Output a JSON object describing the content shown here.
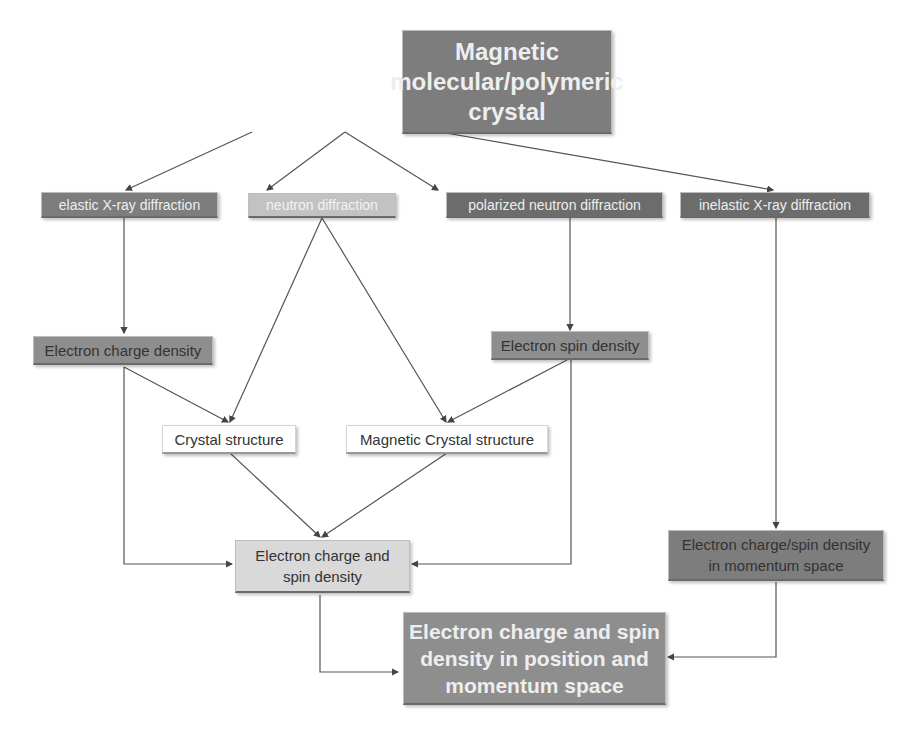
{
  "diagram": {
    "root": {
      "label_lines": [
        "Magnetic",
        "molecular/polymeric",
        "crystal"
      ]
    },
    "methods": [
      {
        "label": "elastic X-ray diffraction"
      },
      {
        "label": "neutron diffraction"
      },
      {
        "label": "polarized neutron diffraction"
      },
      {
        "label": "inelastic X-ray diffraction"
      }
    ],
    "intermediate": {
      "charge_density": "Electron charge density",
      "spin_density": "Electron spin density",
      "crystal_structure": "Crystal structure",
      "magnetic_crystal_structure": "Magnetic Crystal structure",
      "charge_spin_density_lines": [
        "Electron charge and",
        "spin density"
      ],
      "momentum_density_lines": [
        "Electron charge/spin density",
        "in momentum space"
      ]
    },
    "final": {
      "label_lines": [
        "Electron charge and spin",
        "density in position and",
        "momentum space"
      ]
    },
    "colors": {
      "root": "#7d7d7d",
      "elastic": "#7d7d7d",
      "neutron": "#c2c2c2",
      "polarized": "#6c6c6c",
      "inelastic": "#6c6c6c",
      "charge_density": "#8e8e8e",
      "spin_density": "#8e8e8e",
      "charge_spin_density": "#d9d9d9",
      "momentum_density": "#7d7d7d",
      "final": "#8e8e8e",
      "line": "#555555"
    }
  }
}
